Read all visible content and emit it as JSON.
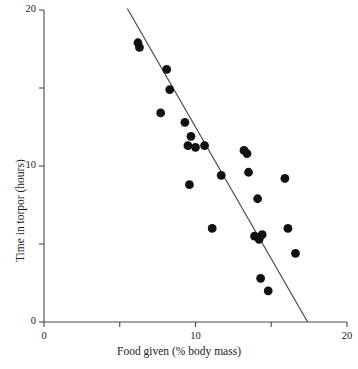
{
  "chart_data": {
    "type": "scatter",
    "title": "",
    "xlabel": "Food given (% body mass)",
    "ylabel": "Time in torpor (hours)",
    "xlim": [
      0,
      20
    ],
    "ylim": [
      0,
      20
    ],
    "xticks": [
      0,
      5,
      10,
      15,
      20
    ],
    "yticks": [
      0,
      5,
      10,
      15,
      20
    ],
    "xtick_labels": [
      "0",
      "",
      "10",
      "",
      "20"
    ],
    "ytick_labels": [
      "0",
      "",
      "10",
      "",
      "20"
    ],
    "grid": false,
    "legend": null,
    "marker": {
      "shape": "circle",
      "color": "#111111",
      "size": 4.4
    },
    "points": [
      {
        "x": 6.2,
        "y": 17.9
      },
      {
        "x": 6.3,
        "y": 17.6
      },
      {
        "x": 8.1,
        "y": 16.2
      },
      {
        "x": 8.3,
        "y": 14.9
      },
      {
        "x": 7.7,
        "y": 13.4
      },
      {
        "x": 9.3,
        "y": 12.8
      },
      {
        "x": 9.7,
        "y": 11.9
      },
      {
        "x": 9.5,
        "y": 11.3
      },
      {
        "x": 10.0,
        "y": 11.2
      },
      {
        "x": 10.6,
        "y": 11.3
      },
      {
        "x": 9.6,
        "y": 8.8
      },
      {
        "x": 11.7,
        "y": 9.4
      },
      {
        "x": 13.2,
        "y": 11.0
      },
      {
        "x": 13.4,
        "y": 10.8
      },
      {
        "x": 13.5,
        "y": 9.6
      },
      {
        "x": 15.9,
        "y": 9.2
      },
      {
        "x": 14.1,
        "y": 7.9
      },
      {
        "x": 11.1,
        "y": 6.0
      },
      {
        "x": 13.9,
        "y": 5.5
      },
      {
        "x": 14.4,
        "y": 5.6
      },
      {
        "x": 14.2,
        "y": 5.3
      },
      {
        "x": 16.1,
        "y": 6.0
      },
      {
        "x": 16.6,
        "y": 4.4
      },
      {
        "x": 14.3,
        "y": 2.8
      },
      {
        "x": 14.8,
        "y": 2.0
      }
    ],
    "fit_line": {
      "label": "regression line",
      "x_start": 5.5,
      "y_start": 20.1,
      "x_end": 17.4,
      "y_end": 0.0,
      "color": "#4a4a4a"
    }
  },
  "axes": {
    "x_tick_labels": [
      {
        "value": "0",
        "x": 0
      },
      {
        "value": "10",
        "x": 10
      },
      {
        "value": "20",
        "x": 20
      }
    ],
    "y_tick_labels": [
      {
        "value": "0",
        "y": 0
      },
      {
        "value": "10",
        "y": 10
      },
      {
        "value": "20",
        "y": 20
      }
    ]
  }
}
